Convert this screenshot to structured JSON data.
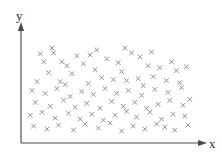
{
  "figure": {
    "width": 222,
    "height": 157,
    "background_color": "#ffffff"
  },
  "axes": {
    "origin": {
      "x": 21,
      "y": 143
    },
    "x_axis": {
      "label": "x",
      "label_position": {
        "x": 209,
        "y": 148
      },
      "start": {
        "x": 21,
        "y": 143
      },
      "end": {
        "x": 203,
        "y": 143
      },
      "arrow": true,
      "color": "#4a4a4a",
      "ticks": [],
      "tick_labels": []
    },
    "y_axis": {
      "label": "y",
      "label_position": {
        "x": 16,
        "y": 20
      },
      "start": {
        "x": 21,
        "y": 143
      },
      "end": {
        "x": 21,
        "y": 26
      },
      "arrow": true,
      "color": "#4a4a4a",
      "ticks": [],
      "tick_labels": []
    }
  },
  "chart_data": {
    "type": "scatter",
    "title": "",
    "subtitle": "",
    "xlabel": "x",
    "ylabel": "y",
    "xlim": [
      0,
      100
    ],
    "ylim": [
      0,
      100
    ],
    "grid": false,
    "legend": null,
    "legend_position": "none",
    "annotations": [],
    "marker": {
      "symbol": "x",
      "color": "#8a8a8a",
      "size_px": 4.6
    },
    "point_count": 92,
    "points": [
      [
        8,
        84
      ],
      [
        16,
        85
      ],
      [
        10,
        76
      ],
      [
        21,
        76
      ],
      [
        24,
        72
      ],
      [
        30,
        82
      ],
      [
        38,
        83
      ],
      [
        34,
        74
      ],
      [
        13,
        65
      ],
      [
        27,
        64
      ],
      [
        41,
        68
      ],
      [
        6,
        56
      ],
      [
        20,
        56
      ],
      [
        48,
        79
      ],
      [
        55,
        75
      ],
      [
        57,
        66
      ],
      [
        63,
        85
      ],
      [
        68,
        81
      ],
      [
        73,
        72
      ],
      [
        80,
        70
      ],
      [
        87,
        76
      ],
      [
        90,
        67
      ],
      [
        96,
        71
      ],
      [
        45,
        60
      ],
      [
        52,
        58
      ],
      [
        60,
        57
      ],
      [
        67,
        59
      ],
      [
        76,
        61
      ],
      [
        84,
        57
      ],
      [
        92,
        55
      ],
      [
        3,
        47
      ],
      [
        11,
        44
      ],
      [
        18,
        49
      ],
      [
        26,
        41
      ],
      [
        33,
        46
      ],
      [
        40,
        43
      ],
      [
        47,
        49
      ],
      [
        54,
        44
      ],
      [
        61,
        47
      ],
      [
        69,
        42
      ],
      [
        77,
        48
      ],
      [
        85,
        45
      ],
      [
        93,
        50
      ],
      [
        5,
        35
      ],
      [
        14,
        31
      ],
      [
        22,
        37
      ],
      [
        29,
        30
      ],
      [
        36,
        34
      ],
      [
        44,
        29
      ],
      [
        51,
        36
      ],
      [
        58,
        31
      ],
      [
        65,
        35
      ],
      [
        72,
        29
      ],
      [
        79,
        33
      ],
      [
        86,
        37
      ],
      [
        94,
        32
      ],
      [
        2,
        22
      ],
      [
        9,
        25
      ],
      [
        17,
        19
      ],
      [
        25,
        24
      ],
      [
        32,
        18
      ],
      [
        39,
        23
      ],
      [
        46,
        17
      ],
      [
        53,
        22
      ],
      [
        60,
        26
      ],
      [
        66,
        20
      ],
      [
        74,
        25
      ],
      [
        81,
        18
      ],
      [
        88,
        23
      ],
      [
        95,
        21
      ],
      [
        4,
        11
      ],
      [
        12,
        8
      ],
      [
        19,
        12
      ],
      [
        28,
        7
      ],
      [
        35,
        13
      ],
      [
        43,
        9
      ],
      [
        50,
        14
      ],
      [
        57,
        6
      ],
      [
        64,
        11
      ],
      [
        71,
        8
      ],
      [
        78,
        13
      ],
      [
        83,
        10
      ],
      [
        89,
        7
      ],
      [
        97,
        12
      ],
      [
        23,
        53
      ],
      [
        37,
        54
      ],
      [
        70,
        52
      ],
      [
        42,
        88
      ],
      [
        59,
        90
      ],
      [
        75,
        86
      ],
      [
        15,
        90
      ],
      [
        98,
        38
      ]
    ]
  }
}
